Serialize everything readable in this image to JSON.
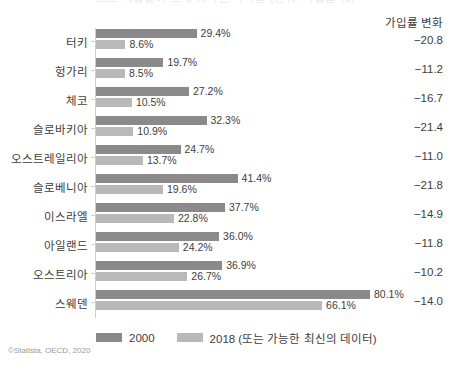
{
  "header": {
    "cut_off_title": "노조 가입률이 크게 하락한 나라들 (단위: 가입률 %)",
    "delta_column_header": "가입률 변화"
  },
  "legend": {
    "items": [
      {
        "label": "2000",
        "color": "#8a8a8a"
      },
      {
        "label": "2018 (또는 가능한 최신의 데이터)",
        "color": "#b9b9b9"
      }
    ]
  },
  "source": "©Statista, OECD, 2020",
  "chart_data": {
    "type": "bar",
    "title": "노조 가입률이 크게 하락한 나라들 (단위: 가입률 %)",
    "orientation": "horizontal",
    "grouped": true,
    "xlabel": "",
    "ylabel": "",
    "xlim": [
      0,
      80.1
    ],
    "grid": false,
    "legend_position": "bottom",
    "categories": [
      "터키",
      "헝가리",
      "체코",
      "슬로바키아",
      "오스트레일리아",
      "슬로베니아",
      "이스라엘",
      "아일랜드",
      "오스트리아",
      "스웨덴"
    ],
    "series": [
      {
        "name": "2000",
        "color": "#8a8a8a",
        "values": [
          29.4,
          19.7,
          27.2,
          32.3,
          24.7,
          41.4,
          37.7,
          36.0,
          36.9,
          80.1
        ],
        "labels": [
          "29.4%",
          "19.7%",
          "27.2%",
          "32.3%",
          "24.7%",
          "41.4%",
          "37.7%",
          "36.0%",
          "36.9%",
          "80.1%"
        ]
      },
      {
        "name": "2018 (또는 가능한 최신의 데이터)",
        "color": "#b9b9b9",
        "values": [
          8.6,
          8.5,
          10.5,
          10.9,
          13.7,
          19.6,
          22.8,
          24.2,
          26.7,
          66.1
        ],
        "labels": [
          "8.6%",
          "8.5%",
          "10.5%",
          "10.9%",
          "13.7%",
          "19.6%",
          "22.8%",
          "24.2%",
          "26.7%",
          "66.1%"
        ]
      }
    ],
    "annotations": {
      "delta_column_header": "가입률 변화",
      "delta_values": [
        "−20.8",
        "−11.2",
        "−16.7",
        "−21.4",
        "−11.0",
        "−21.8",
        "−14.9",
        "−11.8",
        "−10.2",
        "−14.0"
      ]
    }
  }
}
